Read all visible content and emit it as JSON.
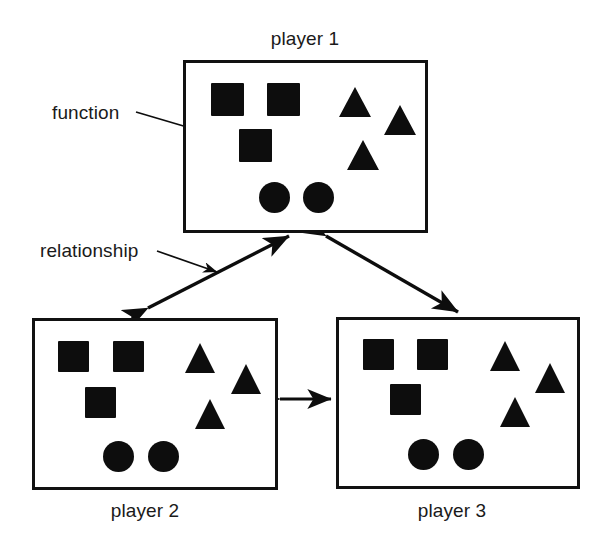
{
  "diagram": {
    "title_visible": false,
    "ink_color": "#0d0d0d",
    "background": "#ffffff",
    "annotations": [
      {
        "name": "function",
        "label": "function",
        "x": 52,
        "y": 102
      },
      {
        "name": "relationship",
        "label": "relationship",
        "x": 40,
        "y": 240
      }
    ],
    "boxes": [
      {
        "id": "player1",
        "label": "player 1",
        "label_position": "above",
        "label_x": 305,
        "label_y": 28,
        "rect": {
          "x": 183,
          "y": 60,
          "w": 245,
          "h": 173
        },
        "shapes": [
          {
            "kind": "square",
            "x": 208,
            "y": 80,
            "size": 33
          },
          {
            "kind": "square",
            "x": 264,
            "y": 80,
            "size": 33
          },
          {
            "kind": "square",
            "x": 236,
            "y": 126,
            "size": 33
          },
          {
            "kind": "triangle",
            "x": 336,
            "y": 84,
            "w": 33,
            "h": 30
          },
          {
            "kind": "triangle",
            "x": 381,
            "y": 102,
            "w": 33,
            "h": 30
          },
          {
            "kind": "triangle",
            "x": 344,
            "y": 137,
            "w": 33,
            "h": 30
          },
          {
            "kind": "circle",
            "x": 256,
            "y": 179,
            "size": 31
          },
          {
            "kind": "circle",
            "x": 300,
            "y": 179,
            "size": 31
          }
        ]
      },
      {
        "id": "player2",
        "label": "player 2",
        "label_position": "below",
        "label_x": 145,
        "label_y": 500,
        "rect": {
          "x": 32,
          "y": 318,
          "w": 246,
          "h": 172
        },
        "shapes": [
          {
            "kind": "square",
            "x": 55,
            "y": 338,
            "size": 31
          },
          {
            "kind": "square",
            "x": 110,
            "y": 338,
            "size": 31
          },
          {
            "kind": "square",
            "x": 82,
            "y": 384,
            "size": 31
          },
          {
            "kind": "triangle",
            "x": 182,
            "y": 340,
            "w": 31,
            "h": 30
          },
          {
            "kind": "triangle",
            "x": 228,
            "y": 361,
            "w": 31,
            "h": 30
          },
          {
            "kind": "triangle",
            "x": 192,
            "y": 396,
            "w": 31,
            "h": 30
          },
          {
            "kind": "circle",
            "x": 100,
            "y": 438,
            "size": 31
          },
          {
            "kind": "circle",
            "x": 145,
            "y": 438,
            "size": 31
          }
        ]
      },
      {
        "id": "player3",
        "label": "player 3",
        "label_position": "below",
        "label_x": 452,
        "label_y": 500,
        "rect": {
          "x": 336,
          "y": 317,
          "w": 244,
          "h": 172
        },
        "shapes": [
          {
            "kind": "square",
            "x": 360,
            "y": 336,
            "size": 31
          },
          {
            "kind": "square",
            "x": 414,
            "y": 336,
            "size": 31
          },
          {
            "kind": "square",
            "x": 387,
            "y": 381,
            "size": 31
          },
          {
            "kind": "triangle",
            "x": 487,
            "y": 338,
            "w": 31,
            "h": 30
          },
          {
            "kind": "triangle",
            "x": 532,
            "y": 360,
            "w": 31,
            "h": 30
          },
          {
            "kind": "triangle",
            "x": 497,
            "y": 394,
            "w": 31,
            "h": 30
          },
          {
            "kind": "circle",
            "x": 405,
            "y": 436,
            "size": 31
          },
          {
            "kind": "circle",
            "x": 450,
            "y": 436,
            "size": 31
          }
        ]
      }
    ],
    "connectors": [
      {
        "name": "player1-player2-relationship",
        "type": "double-arrow",
        "from": {
          "x": 148,
          "y": 308
        },
        "to": {
          "x": 289,
          "y": 236
        }
      },
      {
        "name": "player1-player3-relationship",
        "type": "double-arrow",
        "from": {
          "x": 326,
          "y": 236
        },
        "to": {
          "x": 458,
          "y": 312
        }
      },
      {
        "name": "player2-player3-relationship",
        "type": "double-arrow",
        "from": {
          "x": 279,
          "y": 399
        },
        "to": {
          "x": 332,
          "y": 399
        }
      },
      {
        "name": "function-callout",
        "type": "single-arrow",
        "from": {
          "x": 136,
          "y": 112
        },
        "to": {
          "x": 232,
          "y": 140
        }
      },
      {
        "name": "relationship-callout",
        "type": "single-arrow",
        "from": {
          "x": 157,
          "y": 251
        },
        "to": {
          "x": 218,
          "y": 272
        }
      }
    ]
  }
}
